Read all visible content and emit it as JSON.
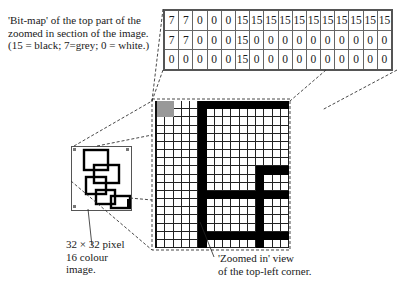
{
  "captions": {
    "bitmap_label": "'Bit-map' of the top part of the\nzoomed in section of the image.\n(15 = black; 7=grey; 0 = white.)",
    "thumbnail_label": "32 × 32 pixel\n16 colour\nimage.",
    "zoomed_label": "'Zoomed in' view\nof the top-left corner."
  },
  "bitmap_rows": [
    [
      "7",
      "7",
      "0",
      "0",
      "0",
      "15",
      "15",
      "15",
      "15",
      "15",
      "15",
      "15",
      "15",
      "15",
      "15",
      "15"
    ],
    [
      "7",
      "7",
      "0",
      "0",
      "0",
      "15",
      "0",
      "0",
      "0",
      "0",
      "0",
      "0",
      "0",
      "0",
      "0",
      "0"
    ],
    [
      "0",
      "0",
      "0",
      "0",
      "0",
      "15",
      "0",
      "0",
      "0",
      "0",
      "0",
      "0",
      "0",
      "0",
      "0",
      "0"
    ]
  ],
  "legend": {
    "black": 15,
    "grey": 7,
    "white": 0
  },
  "colors": {
    "black": "#000000",
    "grey": "#999999",
    "white": "#ffffff"
  },
  "zoom_grid": {
    "columns": 16,
    "rows": 18
  },
  "thumbnail": {
    "width_px": 32,
    "height_px": 32,
    "colours": 16
  }
}
